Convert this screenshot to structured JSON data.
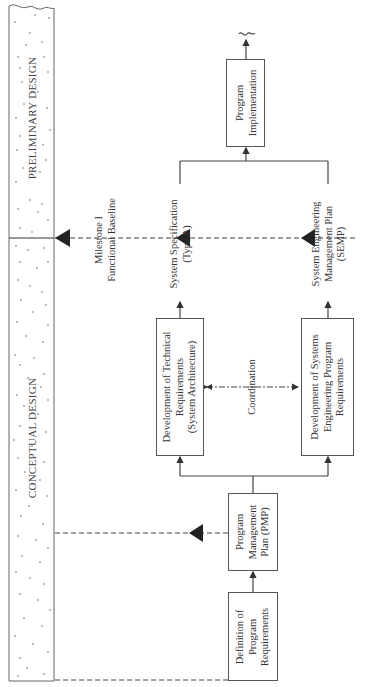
{
  "phases": [
    {
      "id": "preliminary",
      "label": "PRELIMINARY DESIGN"
    },
    {
      "id": "conceptual",
      "label": "CONCEPTUAL DESIGN"
    }
  ],
  "milestone": {
    "label": "Milestone I\nFunctional Baseline"
  },
  "boxes": {
    "definition": "Definition of\nProgram\nRequirements",
    "pmp": "Program\nManagement\nPlan (PMP)",
    "technical": "Development of Technical\nRequirements\n(System Architecture)",
    "systems_eng": "Development of Systems\nEngineering Program\nRequirements",
    "implementation": "Program\nImplementation"
  },
  "labels": {
    "system_spec": "System Specification\n(Type A)",
    "semp": "System Engineering\nManagement Plan\n(SEMP)",
    "coordination": "Coordination"
  },
  "colors": {
    "line": "#444444",
    "arrow": "#222222",
    "box_border": "#555555",
    "dots": "#666666"
  }
}
